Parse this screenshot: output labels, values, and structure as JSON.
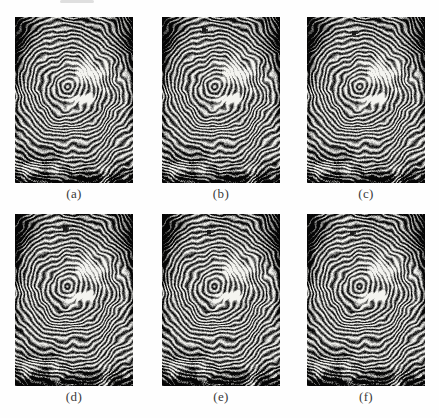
{
  "figure": {
    "type": "fingerprint-grid",
    "rows": 2,
    "cols": 3,
    "panels": [
      {
        "label": "(a)",
        "dot": null
      },
      {
        "label": "(b)",
        "dot": {
          "x": 0.36,
          "y": 0.078
        }
      },
      {
        "label": "(c)",
        "dot": {
          "x": 0.4,
          "y": 0.096
        }
      },
      {
        "label": "(d)",
        "dot": {
          "x": 0.42,
          "y": 0.088
        }
      },
      {
        "label": "(e)",
        "dot": {
          "x": 0.4,
          "y": 0.105
        }
      },
      {
        "label": "(f)",
        "dot": {
          "x": 0.38,
          "y": 0.11
        }
      }
    ],
    "colors": {
      "ridge": "#1d1d1d",
      "valley": "#d9d7d3",
      "blotch_white": "#f4f2ee",
      "dot": "#1a1a1a",
      "label_text": "#3a3a3a",
      "page_background": "#fefefe"
    }
  }
}
